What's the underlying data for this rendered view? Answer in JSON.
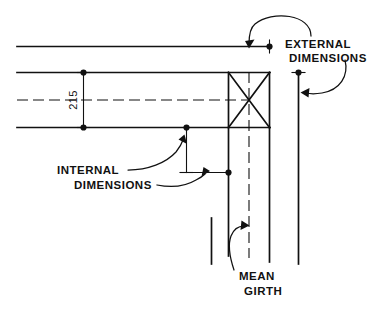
{
  "drawing": {
    "title": "Timber section dimension conventions",
    "background_color": "#ffffff",
    "ink_color": "#111111",
    "annotations": {
      "external": {
        "line1": "EXTERNAL",
        "line2": "DIMENSIONS"
      },
      "internal": {
        "line1": "INTERNAL",
        "line2": "DIMENSIONS"
      },
      "mean_girth": {
        "line1": "MEAN",
        "line2": "GIRTH"
      }
    },
    "dimensions": [
      {
        "name": "vertical-depth",
        "value": "215",
        "orientation": "vertical"
      }
    ],
    "leaders": [
      {
        "name": "external-top-leader",
        "target": "top-outer-edge"
      },
      {
        "name": "external-side-leader",
        "target": "right-outer-edge"
      },
      {
        "name": "internal-vertical-leader",
        "target": "internal-vertical-dimension"
      },
      {
        "name": "internal-horizontal-leader",
        "target": "internal-horizontal-dimension"
      },
      {
        "name": "mean-girth-leader",
        "target": "mean-girth-centreline"
      }
    ],
    "geometry": {
      "corner_box": {
        "name": "corner-cross-box",
        "description": "square with diagonal cross"
      },
      "centrelines": [
        {
          "name": "horizontal-centreline"
        },
        {
          "name": "vertical-centreline"
        }
      ]
    }
  }
}
